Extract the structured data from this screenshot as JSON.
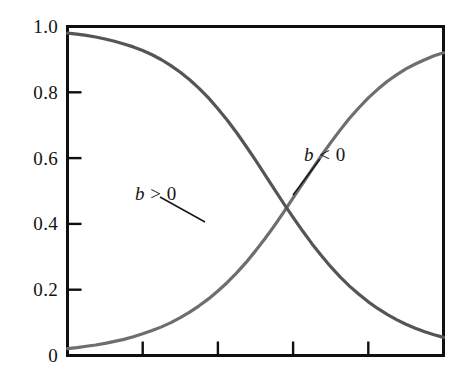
{
  "chart_data": {
    "type": "line",
    "title": "",
    "xlabel": "",
    "ylabel": "",
    "xlim": [
      0,
      10
    ],
    "ylim": [
      0,
      1.0
    ],
    "grid": false,
    "legend_position": "inline-annotations",
    "y_ticks": [
      0,
      0.2,
      0.4,
      0.6,
      0.8,
      1.0
    ],
    "y_tick_labels": [
      "0",
      "0.2",
      "0.4",
      "0.6",
      "0.8",
      "1.0"
    ],
    "x_ticks": [
      0,
      2,
      4,
      6,
      8
    ],
    "x_tick_labels": [
      "",
      "",
      "",
      "",
      ""
    ],
    "annotations": [
      {
        "id": "b-positive",
        "text_var": "b",
        "text_rel": ">",
        "text_num": "0",
        "text": "b > 0",
        "label_x": 135,
        "label_y": 184,
        "leader_from_x": 160,
        "leader_from_y": 197,
        "leader_to_x": 205,
        "leader_to_y": 222
      },
      {
        "id": "b-negative",
        "text_var": "b",
        "text_rel": "<",
        "text_num": "0",
        "text": "b < 0",
        "label_x": 304,
        "label_y": 145,
        "leader_from_x": 320,
        "leader_from_y": 159,
        "leader_to_x": 293,
        "leader_to_y": 195
      }
    ],
    "series": [
      {
        "name": "b > 0",
        "color": "#6e6e6e",
        "shape": "increasing-logistic",
        "x": [
          0.0,
          0.25,
          0.5,
          0.75,
          1.0,
          1.25,
          1.5,
          1.75,
          2.0,
          2.25,
          2.5,
          2.75,
          3.0,
          3.25,
          3.5,
          3.75,
          4.0,
          4.25,
          4.5,
          4.75,
          5.0,
          5.25,
          5.5,
          5.75,
          6.0,
          6.25,
          6.5,
          6.75,
          7.0,
          7.25,
          7.5,
          7.75,
          8.0,
          8.25,
          8.5,
          8.75,
          9.0,
          9.25,
          9.5,
          9.75,
          10.0
        ],
        "y": [
          0.021,
          0.024,
          0.028,
          0.032,
          0.037,
          0.043,
          0.049,
          0.057,
          0.066,
          0.076,
          0.087,
          0.1,
          0.115,
          0.132,
          0.151,
          0.172,
          0.196,
          0.222,
          0.251,
          0.283,
          0.318,
          0.355,
          0.394,
          0.436,
          0.479,
          0.522,
          0.565,
          0.607,
          0.647,
          0.685,
          0.721,
          0.753,
          0.783,
          0.809,
          0.833,
          0.853,
          0.871,
          0.886,
          0.899,
          0.911,
          0.92
        ]
      },
      {
        "name": "b < 0",
        "color": "#555555",
        "shape": "decreasing-logistic",
        "x": [
          0.0,
          0.25,
          0.5,
          0.75,
          1.0,
          1.25,
          1.5,
          1.75,
          2.0,
          2.25,
          2.5,
          2.75,
          3.0,
          3.25,
          3.5,
          3.75,
          4.0,
          4.25,
          4.5,
          4.75,
          5.0,
          5.25,
          5.5,
          5.75,
          6.0,
          6.25,
          6.5,
          6.75,
          7.0,
          7.25,
          7.5,
          7.75,
          8.0,
          8.25,
          8.5,
          8.75,
          9.0,
          9.25,
          9.5,
          9.75,
          10.0
        ],
        "y": [
          0.98,
          0.977,
          0.973,
          0.968,
          0.962,
          0.955,
          0.947,
          0.938,
          0.927,
          0.914,
          0.899,
          0.881,
          0.861,
          0.838,
          0.812,
          0.783,
          0.75,
          0.715,
          0.677,
          0.636,
          0.594,
          0.55,
          0.506,
          0.462,
          0.42,
          0.379,
          0.34,
          0.304,
          0.27,
          0.239,
          0.211,
          0.186,
          0.163,
          0.143,
          0.125,
          0.109,
          0.095,
          0.083,
          0.072,
          0.063,
          0.055
        ]
      }
    ],
    "crossing_point": {
      "x": 5.65,
      "y": 0.72
    },
    "colors": {
      "axis": "#0f0f0f",
      "background": "#ffffff",
      "curve_increasing": "#6e6e6e",
      "curve_decreasing": "#555555",
      "text": "#131313"
    }
  }
}
